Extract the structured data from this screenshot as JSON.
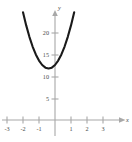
{
  "chart_data": {
    "type": "line",
    "title": "",
    "xlabel": "x",
    "ylabel": "y",
    "xlim": [
      -3.6,
      4.0
    ],
    "ylim": [
      -1.5,
      23.5
    ],
    "grid": false,
    "legend": null,
    "function": "y = 5x^2 + 4x + 12.5",
    "vertex": [
      -0.4,
      11.7
    ],
    "x_ticks": [
      -3,
      -2,
      -1,
      1,
      2,
      3
    ],
    "x_tick_labels": [
      "-3",
      "-2",
      "-1",
      "1",
      "2",
      "3"
    ],
    "y_ticks": [
      5,
      10,
      15,
      20
    ],
    "y_tick_labels": [
      "5",
      "10",
      "15",
      "20"
    ],
    "series": [
      {
        "name": "parabola",
        "color": "#1a1a1a",
        "x": [
          -2.0,
          -1.8,
          -1.6,
          -1.4,
          -1.2,
          -1.0,
          -0.8,
          -0.6,
          -0.4,
          -0.2,
          0.0,
          0.2,
          0.4,
          0.6,
          0.8,
          1.0,
          1.2
        ],
        "y": [
          24.5,
          21.5,
          18.9,
          16.7,
          14.9,
          13.5,
          12.5,
          11.9,
          11.7,
          11.9,
          12.5,
          13.5,
          14.9,
          16.7,
          18.9,
          21.5,
          24.5
        ]
      }
    ]
  },
  "axes": {
    "x_axis_name": "x",
    "y_axis_name": "y"
  },
  "colors": {
    "curve": "#1a1a1a",
    "axis": "#a8a8a8",
    "label": "#4a4a4a",
    "background": "#ffffff"
  }
}
